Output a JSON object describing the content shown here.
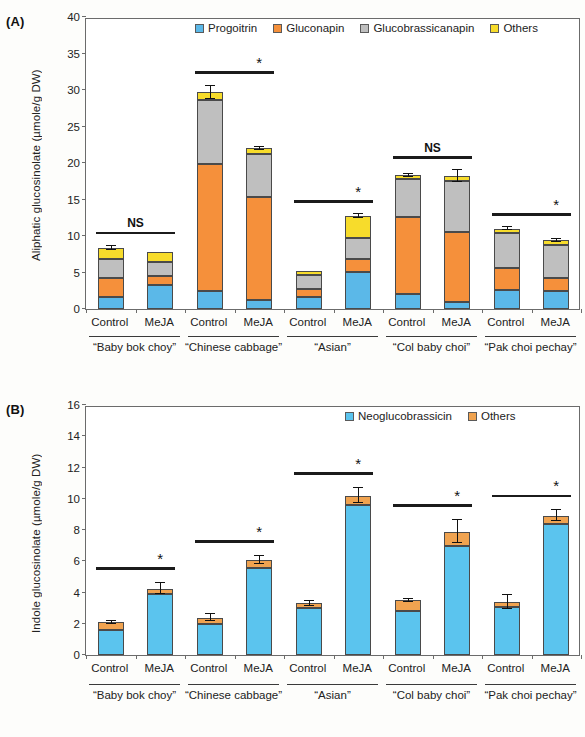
{
  "figure": {
    "panel_a_tag": "(A)",
    "panel_b_tag": "(B)"
  },
  "colors": {
    "progoitrin": "#5BB8E8",
    "gluconapin": "#F5903B",
    "glucobrassicanapin": "#BFBFBF",
    "others_aliphatic": "#F7DC2B",
    "neoglucobrassicin": "#5BC4EE",
    "others_indole": "#F0A350",
    "axis": "#6b6b6b",
    "sig_line": "#1b1b1b"
  },
  "chart_data": [
    {
      "type": "bar",
      "panel": "(A)",
      "stacked": true,
      "title": "",
      "xlabel": "",
      "ylabel": "Aliphatic glucosinolate (µmole/g DW)",
      "ylim": [
        0,
        40
      ],
      "yticks": [
        0,
        5,
        10,
        15,
        20,
        25,
        30,
        35,
        40
      ],
      "grid": false,
      "legend_position": "top-center",
      "categories": [
        "Control",
        "MeJA",
        "Control",
        "MeJA",
        "Control",
        "MeJA",
        "Control",
        "MeJA",
        "Control",
        "MeJA"
      ],
      "groups": [
        {
          "label": "“Baby bok choy”",
          "bars": [
            "Control",
            "MeJA"
          ]
        },
        {
          "label": "“Chinese cabbage”",
          "bars": [
            "Control",
            "MeJA"
          ]
        },
        {
          "label": "“Asian”",
          "bars": [
            "Control",
            "MeJA"
          ]
        },
        {
          "label": "“Col baby choi”",
          "bars": [
            "Control",
            "MeJA"
          ]
        },
        {
          "label": "“Pak choi pechay”",
          "bars": [
            "Control",
            "MeJA"
          ]
        }
      ],
      "series": [
        {
          "name": "Progoitrin",
          "color": "#5BB8E8",
          "values": [
            1.6,
            3.3,
            2.4,
            1.2,
            1.6,
            5.1,
            2.0,
            1.0,
            2.6,
            2.5
          ]
        },
        {
          "name": "Gluconapin",
          "color": "#F5903B",
          "values": [
            2.6,
            1.2,
            17.4,
            14.1,
            1.2,
            1.7,
            10.6,
            9.6,
            3.0,
            1.8
          ]
        },
        {
          "name": "Glucobrassicanapin",
          "color": "#BFBFBF",
          "values": [
            2.7,
            1.9,
            8.8,
            5.9,
            1.8,
            2.9,
            5.2,
            6.9,
            4.8,
            4.5
          ]
        },
        {
          "name": "Others",
          "color": "#F7DC2B",
          "values": [
            1.5,
            1.4,
            1.1,
            0.8,
            0.6,
            3.0,
            0.5,
            0.7,
            0.6,
            0.6
          ]
        }
      ],
      "totals": [
        8.4,
        7.8,
        29.7,
        22.0,
        5.2,
        12.7,
        18.3,
        18.2,
        11.0,
        9.4
      ],
      "error_bars": [
        0.25,
        0.0,
        0.9,
        0.2,
        0.0,
        0.25,
        0.2,
        0.8,
        0.2,
        0.2
      ],
      "significance": [
        {
          "group": "“Baby bok choy”",
          "label": "NS"
        },
        {
          "group": "“Chinese cabbage”",
          "label": "*"
        },
        {
          "group": "“Asian”",
          "label": "*"
        },
        {
          "group": "“Col baby choi”",
          "label": "NS"
        },
        {
          "group": "“Pak choi pechay”",
          "label": "*"
        }
      ]
    },
    {
      "type": "bar",
      "panel": "(B)",
      "stacked": true,
      "title": "",
      "xlabel": "",
      "ylabel": "Indole glucosinolate (µmole/g DW)",
      "ylim": [
        0,
        16
      ],
      "yticks": [
        0,
        2,
        4,
        6,
        8,
        10,
        12,
        14,
        16
      ],
      "grid": false,
      "legend_position": "top-right",
      "categories": [
        "Control",
        "MeJA",
        "Control",
        "MeJA",
        "Control",
        "MeJA",
        "Control",
        "MeJA",
        "Control",
        "MeJA"
      ],
      "groups": [
        {
          "label": "“Baby bok choy”",
          "bars": [
            "Control",
            "MeJA"
          ]
        },
        {
          "label": "“Chinese cabbage”",
          "bars": [
            "Control",
            "MeJA"
          ]
        },
        {
          "label": "“Asian”",
          "bars": [
            "Control",
            "MeJA"
          ]
        },
        {
          "label": "“Col baby choi”",
          "bars": [
            "Control",
            "MeJA"
          ]
        },
        {
          "label": "“Pak choi pechay”",
          "bars": [
            "Control",
            "MeJA"
          ]
        }
      ],
      "series": [
        {
          "name": "Neoglucobrassicin",
          "color": "#5BC4EE",
          "values": [
            1.6,
            3.9,
            2.0,
            5.6,
            3.0,
            9.6,
            2.8,
            7.0,
            3.1,
            8.4
          ]
        },
        {
          "name": "Others",
          "color": "#F0A350",
          "values": [
            0.5,
            0.35,
            0.4,
            0.5,
            0.3,
            0.6,
            0.7,
            0.9,
            0.3,
            0.5
          ]
        }
      ],
      "totals": [
        2.1,
        4.25,
        2.4,
        6.1,
        3.3,
        10.2,
        3.5,
        7.9,
        3.4,
        8.9
      ],
      "error_bars": [
        0.1,
        0.35,
        0.2,
        0.25,
        0.15,
        0.5,
        0.1,
        0.75,
        0.45,
        0.35
      ],
      "significance": [
        {
          "group": "“Baby bok choy”",
          "label": "*"
        },
        {
          "group": "“Chinese cabbage”",
          "label": "*"
        },
        {
          "group": "“Asian”",
          "label": "*"
        },
        {
          "group": "“Col baby choi”",
          "label": "*"
        },
        {
          "group": "“Pak choi pechay”",
          "label": "*"
        }
      ]
    }
  ]
}
